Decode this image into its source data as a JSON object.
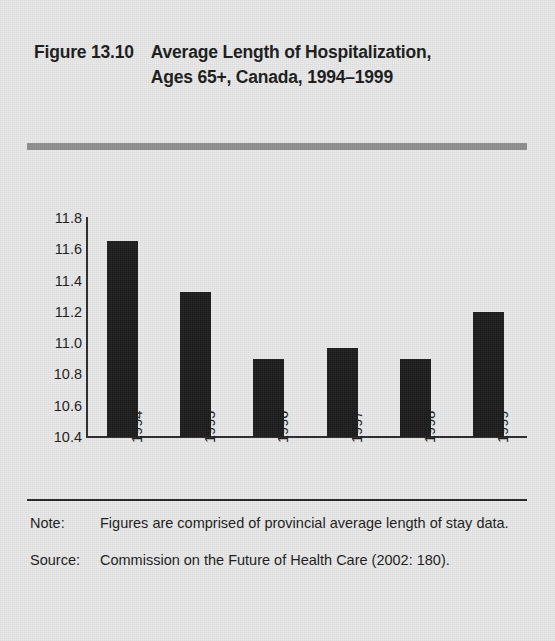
{
  "figure": {
    "number": "Figure 13.10",
    "title": "Average Length of Hospitalization, Ages 65+, Canada, 1994–1999"
  },
  "notes": {
    "note_label": "Note:",
    "note_text": "Figures are comprised of provincial average length of stay data.",
    "source_label": "Source:",
    "source_text": "Commission on the Future of Health Care (2002: 180)."
  },
  "colors": {
    "page_background": "#e9e9e9",
    "bar_fill": "#1c1c1c",
    "axis": "#2b2b2b",
    "gray_rule": "#8f8f8f",
    "black_rule": "#262626"
  },
  "chart_data": {
    "type": "bar",
    "title": "Average Length of Hospitalization, Ages 65+, Canada, 1994–1999",
    "xlabel": "",
    "ylabel": "",
    "categories": [
      "1994",
      "1995",
      "1996",
      "1997",
      "1998",
      "1999"
    ],
    "values": [
      11.65,
      11.33,
      10.9,
      10.97,
      10.9,
      11.2
    ],
    "ylim": [
      10.4,
      11.8
    ],
    "yticks": [
      "11.8",
      "11.6",
      "11.4",
      "11.2",
      "11.0",
      "10.8",
      "10.6",
      "10.4"
    ],
    "ytick_values": [
      11.8,
      11.6,
      11.4,
      11.2,
      11.0,
      10.8,
      10.6,
      10.4
    ],
    "grid": false,
    "legend": null,
    "units": "days"
  }
}
